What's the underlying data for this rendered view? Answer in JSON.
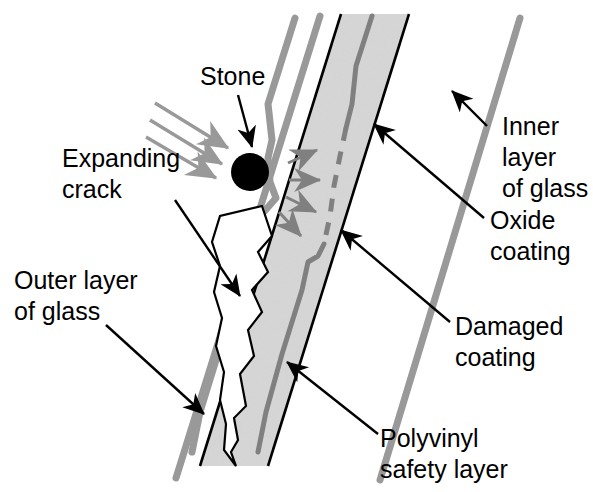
{
  "figure": {
    "type": "cross-section-diagram",
    "background_color": "#ffffff"
  },
  "colors": {
    "glass_line": "#999999",
    "pvb_fill": "#dcdcdc",
    "pvb_outline": "#000000",
    "oxide_coating": "#808080",
    "stone": "#000000",
    "leader_line": "#000000",
    "impact_arrow": "#999999",
    "shock_arrow": "#808080",
    "crack_outline": "#000000",
    "text": "#000000"
  },
  "labels": [
    {
      "id": "stone",
      "name": "stone",
      "lines": [
        "Stone"
      ],
      "x": 200,
      "y": 78,
      "anchor": "start"
    },
    {
      "id": "expanding-crack",
      "name": "expanding-crack",
      "lines": [
        "Expanding",
        "crack"
      ],
      "x": 62,
      "y": 160,
      "anchor": "start"
    },
    {
      "id": "outer-layer-of-glass",
      "name": "outer-layer-of-glass",
      "lines": [
        "Outer layer",
        "of glass"
      ],
      "x": 14,
      "y": 282,
      "anchor": "start"
    },
    {
      "id": "inner-layer-of-glass",
      "name": "inner-layer-of-glass",
      "lines": [
        "Inner",
        "layer",
        "of glass"
      ],
      "x": 502,
      "y": 128,
      "anchor": "start"
    },
    {
      "id": "oxide-coating",
      "name": "oxide-coating",
      "lines": [
        "Oxide",
        "coating"
      ],
      "x": 490,
      "y": 222,
      "anchor": "start"
    },
    {
      "id": "damaged-coating",
      "name": "damaged-coating",
      "lines": [
        "Damaged",
        "coating"
      ],
      "x": 455,
      "y": 328,
      "anchor": "start"
    },
    {
      "id": "polyvinyl-safety-layer",
      "name": "polyvinyl-safety-layer",
      "lines": [
        "Polyvinyl",
        "safety layer"
      ],
      "x": 380,
      "y": 440,
      "anchor": "start"
    }
  ],
  "structures": {
    "outer_glass_surface": {
      "name": "outer-layer-of-glass-line",
      "description": "Leftmost thick gray line: outer glass outer surface",
      "points": "320,16 176,478"
    },
    "outer_glass_inner_surface": {
      "name": "outer-glass-inner-surface-line",
      "description": "Gray line forming the inner face of the outer glass, deflected around the stone",
      "points": "295,18 268,104 272,140 268,158 270,182 276,198 262,214 254,240 236,296 216,360 200,412 192,452"
    },
    "pvb_band": {
      "name": "polyvinyl-safety-layer-band",
      "description": "Shaded polyvinyl interlayer band between the two glass plies",
      "left_edge": "341,14 200,466",
      "right_edge": "409,14 268,466"
    },
    "oxide_coating_line": {
      "name": "oxide-coating-line",
      "description": "Gray coating line inside the band; solid above, dashed where damaged, solid again below",
      "solid_upper": "372,16 356,66 352,104 346,128",
      "dashed_damaged": "346,128 340,156 334,186 330,216 324,244",
      "solid_lower": "324,244 318,256 308,262 302,290 282,354 266,412 258,452"
    },
    "inner_glass_surface": {
      "name": "inner-layer-of-glass-line",
      "description": "Rightmost thick gray line: inner glass inner surface",
      "points": "520,18 380,480"
    },
    "stone": {
      "name": "stone-circle",
      "cx": 250,
      "cy": 172,
      "r": 19
    },
    "crack": {
      "name": "expanding-crack-wedge",
      "description": "Zigzag wedge-shaped crack propagating down from the impact point through the outer glass",
      "outline": "262,206 272,236 258,252 268,272 252,290 262,312 248,330 254,356 240,374 246,406 234,418 238,440 231,452 236,466 224,450 226,424 220,400 224,372 216,346 222,318 214,292 220,266 212,242 220,216"
    },
    "impact_arrows": {
      "name": "impact-arrow",
      "description": "Three parallel gray arrows showing the stone trajectory toward the impact point",
      "arrows": [
        "155,103 228,148",
        "150,120 222,164",
        "146,137 216,178"
      ]
    },
    "shock_arrows": {
      "name": "shock-wave-arrow",
      "description": "Four small gray arrows radiating from the impact point into the interlayer",
      "arrows": [
        "288,163 317,150",
        "289,180 320,180",
        "286,197 316,212",
        "279,212 301,236"
      ]
    }
  },
  "leaders": [
    {
      "id": "stone-leader",
      "name": "leader-stone",
      "from_label": "stone",
      "path": "238,95 252,147",
      "arrow_at": "end"
    },
    {
      "id": "expanding-crack-leader",
      "name": "leader-expanding-crack",
      "from_label": "expanding-crack",
      "path": "175,200 240,296",
      "arrow_at": "end"
    },
    {
      "id": "outer-layer-leader",
      "name": "leader-outer-layer-of-glass",
      "from_label": "outer-layer-of-glass",
      "path": "106,325 204,414",
      "arrow_at": "end"
    },
    {
      "id": "inner-layer-leader",
      "name": "leader-inner-layer-of-glass",
      "from_label": "inner-layer-of-glass",
      "path": "487,126 452,91",
      "arrow_at": "end"
    },
    {
      "id": "oxide-coating-leader",
      "name": "leader-oxide-coating",
      "from_label": "oxide-coating",
      "path": "484,218 374,124",
      "arrow_at": "end"
    },
    {
      "id": "damaged-coating-leader",
      "name": "leader-damaged-coating",
      "from_label": "damaged-coating",
      "path": "450,322 341,230",
      "arrow_at": "end"
    },
    {
      "id": "polyvinyl-leader",
      "name": "leader-polyvinyl-safety-layer",
      "from_label": "polyvinyl-safety-layer",
      "path": "378,434 287,362",
      "arrow_at": "end"
    }
  ]
}
